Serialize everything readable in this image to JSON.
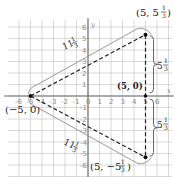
{
  "diagram": {
    "x_axis": {
      "name": "x",
      "min": -6,
      "max": 6,
      "ticks": [
        "-6",
        "-5",
        "-4",
        "-3",
        "-2",
        "-1",
        "0",
        "1",
        "2",
        "3",
        "4",
        "5",
        "6"
      ]
    },
    "y_axis": {
      "name": "y",
      "min": -6,
      "max": 6,
      "ticks": [
        "6",
        "5",
        "4",
        "3",
        "2",
        "1",
        "-1",
        "-2",
        "-3",
        "-4",
        "-5",
        "-6"
      ]
    },
    "vertices": [
      {
        "id": "left",
        "x": -5,
        "y": 0,
        "label": "(−5, 0)"
      },
      {
        "id": "top",
        "x": 5,
        "y": 5.3333,
        "label_main": "(5, 5",
        "label_frac_num": "1",
        "label_frac_den": "3",
        "label_close": ")"
      },
      {
        "id": "bottom",
        "x": 5,
        "y": -5.3333,
        "label_main": "(5, −5",
        "label_frac_num": "1",
        "label_frac_den": "3",
        "label_close": ")"
      }
    ],
    "foot_point": {
      "x": 5,
      "y": 0,
      "label": "(5, 0)"
    },
    "side_lengths": {
      "upper_slant": {
        "whole": "11",
        "num": "1",
        "den": "3"
      },
      "lower_slant": {
        "whole": "11",
        "num": "1",
        "den": "3"
      },
      "upper_vertical": {
        "whole": "5",
        "num": "1",
        "den": "3"
      },
      "lower_vertical": {
        "whole": "5",
        "num": "1",
        "den": "3"
      }
    }
  }
}
